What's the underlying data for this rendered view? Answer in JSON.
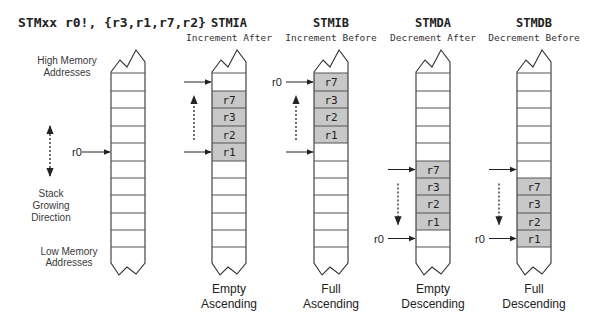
{
  "instruction": "STMxx r0!, {r3,r1,r7,r2}",
  "colors": {
    "stroke": "#333333",
    "cell_line": "#555555",
    "filled_cell": "#c8c8c8",
    "empty_cell": "#ffffff",
    "text": "#222222",
    "label_text": "#3a3a3a"
  },
  "reference_column": {
    "high_label": [
      "High Memory",
      "Addresses"
    ],
    "low_label": [
      "Low Memory",
      "Addresses"
    ],
    "growth_label": [
      "Stack",
      "Growing",
      "Direction"
    ],
    "pointer_label": "r0"
  },
  "modes": [
    {
      "mnemonic": "STMIA",
      "subtitle": "Increment After",
      "caption": [
        "Empty",
        "Ascending"
      ],
      "cells": {
        "1": "r7",
        "2": "r3",
        "3": "r2",
        "4": "r1"
      },
      "r0_label_at": "none",
      "start_pointer_cell": 4,
      "end_pointer_cell": 0,
      "direction": "up"
    },
    {
      "mnemonic": "STMIB",
      "subtitle": "Increment Before",
      "caption": [
        "Full",
        "Ascending"
      ],
      "cells": {
        "0": "r7",
        "1": "r3",
        "2": "r2",
        "3": "r1"
      },
      "r0_label_at": "end",
      "start_pointer_cell": 4,
      "end_pointer_cell": 0,
      "direction": "up",
      "r0_label": "r0"
    },
    {
      "mnemonic": "STMDA",
      "subtitle": "Decrement After",
      "caption": [
        "Empty",
        "Descending"
      ],
      "cells": {
        "5": "r7",
        "6": "r3",
        "7": "r2",
        "8": "r1"
      },
      "start_pointer_cell": 5,
      "end_pointer_cell": 9,
      "direction": "down",
      "r0_label": "r0"
    },
    {
      "mnemonic": "STMDB",
      "subtitle": "Decrement Before",
      "caption": [
        "Full",
        "Descending"
      ],
      "cells": {
        "6": "r7",
        "7": "r3",
        "8": "r2",
        "9": "r1"
      },
      "start_pointer_cell": 5,
      "end_pointer_cell": 9,
      "direction": "down",
      "r0_label": "r0"
    }
  ]
}
